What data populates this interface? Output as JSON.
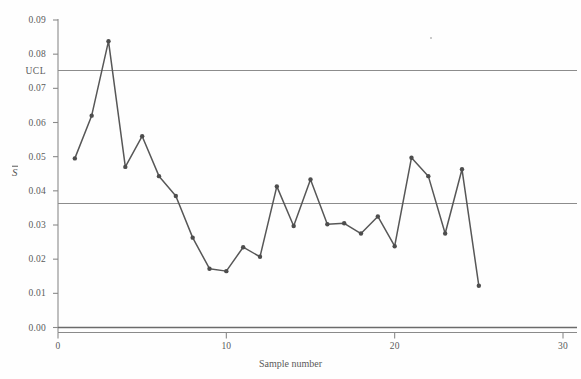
{
  "chart_data": {
    "type": "line",
    "title": "",
    "xlabel": "Sample number",
    "ylabel": "S̄",
    "xlim": [
      0,
      30.5
    ],
    "ylim": [
      0.0,
      0.093
    ],
    "grid": false,
    "legend_position": "none",
    "x": [
      1,
      2,
      3,
      4,
      5,
      6,
      7,
      8,
      9,
      10,
      11,
      12,
      13,
      14,
      15,
      16,
      17,
      18,
      19,
      20,
      21,
      22,
      23,
      24,
      25
    ],
    "values": [
      0.0495,
      0.062,
      0.0838,
      0.047,
      0.056,
      0.0443,
      0.0385,
      0.0263,
      0.0172,
      0.0165,
      0.0235,
      0.0207,
      0.0413,
      0.0297,
      0.0433,
      0.0302,
      0.0305,
      0.0275,
      0.0325,
      0.0238,
      0.0497,
      0.0443,
      0.0275,
      0.0463,
      0.0122
    ],
    "series": [
      {
        "name": "S-bar",
        "values": [
          0.0495,
          0.062,
          0.0838,
          0.047,
          0.056,
          0.0443,
          0.0385,
          0.0263,
          0.0172,
          0.0165,
          0.0235,
          0.0207,
          0.0413,
          0.0297,
          0.0433,
          0.0302,
          0.0305,
          0.0275,
          0.0325,
          0.0238,
          0.0497,
          0.0443,
          0.0275,
          0.0463,
          0.0122
        ]
      }
    ],
    "control_limits": {
      "ucl": 0.0752,
      "ucl_label": "UCL",
      "center_line": 0.0363,
      "lcl": 0.0,
      "lcl_label": ""
    },
    "yticks": [
      "0.00",
      "0.01",
      "0.02",
      "0.03",
      "0.04",
      "0.05",
      "0.06",
      "0.07",
      "0.08",
      "0.09"
    ],
    "ytick_values": [
      0.0,
      0.01,
      0.02,
      0.03,
      0.04,
      0.05,
      0.06,
      0.07,
      0.08,
      0.09
    ],
    "xticks": [
      "0",
      "10",
      "20",
      "30"
    ],
    "xtick_values": [
      0,
      10,
      20,
      30
    ],
    "colors": {
      "series_line": "#575757",
      "series_marker": "#4d4d4d",
      "limit_line": "#8c8c8c",
      "center_line": "#8c8c8c",
      "lcl_line": "#6b6b6b",
      "axis": "#8a8a8a",
      "text": "#5a5a5a",
      "background": "#fefefe"
    }
  }
}
